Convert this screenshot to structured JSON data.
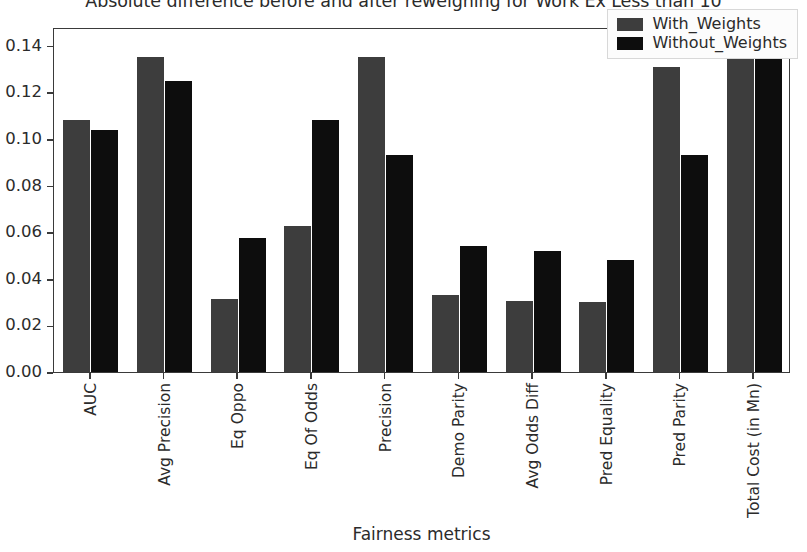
{
  "chart_data": {
    "type": "bar",
    "title": "Absolute difference before and after reweighing for Work Ex Less than 10",
    "xlabel": "Fairness metrics",
    "ylabel": "",
    "ylim": [
      0.0,
      0.148
    ],
    "yticks": [
      "0.00",
      "0.02",
      "0.04",
      "0.06",
      "0.08",
      "0.10",
      "0.12",
      "0.14"
    ],
    "ytick_values": [
      0.0,
      0.02,
      0.04,
      0.06,
      0.08,
      0.1,
      0.12,
      0.14
    ],
    "grid": false,
    "legend_position": "upper right",
    "categories": [
      "AUC",
      "Avg Precision",
      "Eq Oppo",
      "Eq Of Odds",
      "Precision",
      "Demo Parity",
      "Avg Odds Diff",
      "Pred Equality",
      "Pred Parity",
      "Total Cost (in Mn)"
    ],
    "series": [
      {
        "name": "With_Weights",
        "color": "#3d3d3d",
        "values": [
          0.108,
          0.135,
          0.0315,
          0.0625,
          0.135,
          0.033,
          0.0305,
          0.03,
          0.131,
          0.146
        ]
      },
      {
        "name": "Without_Weights",
        "color": "#0d0d0d",
        "values": [
          0.104,
          0.125,
          0.0575,
          0.108,
          0.093,
          0.054,
          0.052,
          0.048,
          0.093,
          0.147
        ]
      }
    ]
  },
  "figure": {
    "background": "#ffffff",
    "axes_color": "#3a3a3a",
    "text_color": "#2b2b2b"
  }
}
